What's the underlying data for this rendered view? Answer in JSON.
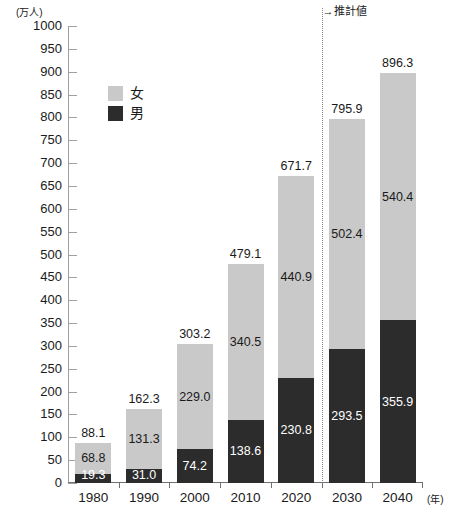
{
  "chart_data": {
    "type": "bar",
    "stacked": true,
    "title": "",
    "subtitle": "",
    "xlabel": "(年)",
    "ylabel": "(万人)",
    "categories": [
      "1980",
      "1990",
      "2000",
      "2010",
      "2020",
      "2030",
      "2040"
    ],
    "ylim": [
      0,
      1000
    ],
    "ytick_step": 50,
    "yticks": [
      "1000",
      "950",
      "900",
      "850",
      "800",
      "750",
      "700",
      "650",
      "600",
      "550",
      "500",
      "450",
      "400",
      "350",
      "300",
      "250",
      "200",
      "150",
      "100",
      "50",
      "0"
    ],
    "grid": false,
    "legend_position": "inside-upper-left",
    "series": [
      {
        "name": "女",
        "key": "female",
        "color": "#c9c9c9",
        "values": [
          68.8,
          131.3,
          229.0,
          340.5,
          440.9,
          502.4,
          540.4
        ]
      },
      {
        "name": "男",
        "key": "male",
        "color": "#2c2c2c",
        "values": [
          19.3,
          31.0,
          74.2,
          138.6,
          230.8,
          293.5,
          355.9
        ]
      }
    ],
    "totals": [
      88.1,
      162.3,
      303.2,
      479.1,
      671.7,
      795.9,
      896.3
    ],
    "annotations": [
      {
        "name": "forecast-divider",
        "text": "→推計値",
        "after_category": "2020",
        "style": "dotted-vertical-line"
      }
    ]
  },
  "colors": {
    "female": "#c9c9c9",
    "male": "#2c2c2c",
    "axis": "#6f6f6f",
    "tick": "#a0a0a0",
    "text": "#1a1a1a",
    "label_on_dark": "#ffffff",
    "background": "#ffffff"
  }
}
